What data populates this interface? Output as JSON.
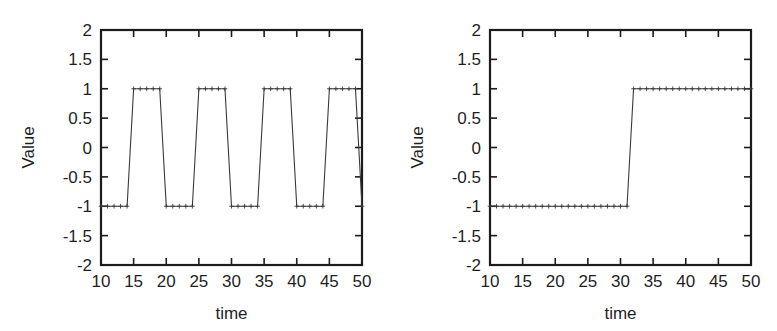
{
  "figure": {
    "background": "#ffffff",
    "line_color": "#3a3a3a",
    "axis_color": "#1c1c1c",
    "panel_count": 2
  },
  "chart_data": [
    {
      "id": "left-panel",
      "type": "line",
      "title": "",
      "xlabel": "time",
      "ylabel": "Value",
      "xlim": [
        10,
        50
      ],
      "ylim": [
        -2,
        2
      ],
      "xticks": [
        10,
        15,
        20,
        25,
        30,
        35,
        40,
        45,
        50
      ],
      "xticklabels": [
        "10",
        "15",
        "20",
        "25",
        "30",
        "35",
        "40",
        "45",
        "50"
      ],
      "yticks": [
        -2,
        -1.5,
        -1,
        -0.5,
        0,
        0.5,
        1,
        1.5,
        2
      ],
      "yticklabels": [
        "-2",
        "-1.5",
        "-1",
        "-0.5",
        "0",
        "0.5",
        "1",
        "1.5",
        "2"
      ],
      "grid": false,
      "legend": "none",
      "marker": "plus",
      "linestyle": "solid",
      "description": "Periodic square wave alternating between -1 and 1 with period 10",
      "x": [
        10,
        11,
        12,
        13,
        14,
        15,
        16,
        17,
        18,
        19,
        20,
        21,
        22,
        23,
        24,
        25,
        26,
        27,
        28,
        29,
        30,
        31,
        32,
        33,
        34,
        35,
        36,
        37,
        38,
        39,
        40,
        41,
        42,
        43,
        44,
        45,
        46,
        47,
        48,
        49,
        50
      ],
      "values": [
        -1,
        -1,
        -1,
        -1,
        -1,
        1,
        1,
        1,
        1,
        1,
        -1,
        -1,
        -1,
        -1,
        -1,
        1,
        1,
        1,
        1,
        1,
        -1,
        -1,
        -1,
        -1,
        -1,
        1,
        1,
        1,
        1,
        1,
        -1,
        -1,
        -1,
        -1,
        -1,
        1,
        1,
        1,
        1,
        1,
        -1
      ]
    },
    {
      "id": "right-panel",
      "type": "line",
      "title": "",
      "xlabel": "time",
      "ylabel": "Value",
      "xlim": [
        10,
        50
      ],
      "ylim": [
        -2,
        2
      ],
      "xticks": [
        10,
        15,
        20,
        25,
        30,
        35,
        40,
        45,
        50
      ],
      "xticklabels": [
        "10",
        "15",
        "20",
        "25",
        "30",
        "35",
        "40",
        "45",
        "50"
      ],
      "yticks": [
        -2,
        -1.5,
        -1,
        -0.5,
        0,
        0.5,
        1,
        1.5,
        2
      ],
      "yticklabels": [
        "-2",
        "-1.5",
        "-1",
        "-0.5",
        "0",
        "0.5",
        "1",
        "1.5",
        "2"
      ],
      "grid": false,
      "legend": "none",
      "marker": "plus",
      "linestyle": "solid",
      "description": "Single step transition from -1 to 1 at time 31",
      "x": [
        10,
        11,
        12,
        13,
        14,
        15,
        16,
        17,
        18,
        19,
        20,
        21,
        22,
        23,
        24,
        25,
        26,
        27,
        28,
        29,
        30,
        31,
        32,
        33,
        34,
        35,
        36,
        37,
        38,
        39,
        40,
        41,
        42,
        43,
        44,
        45,
        46,
        47,
        48,
        49,
        50
      ],
      "values": [
        -1,
        -1,
        -1,
        -1,
        -1,
        -1,
        -1,
        -1,
        -1,
        -1,
        -1,
        -1,
        -1,
        -1,
        -1,
        -1,
        -1,
        -1,
        -1,
        -1,
        -1,
        -1,
        1,
        1,
        1,
        1,
        1,
        1,
        1,
        1,
        1,
        1,
        1,
        1,
        1,
        1,
        1,
        1,
        1,
        1,
        1
      ]
    }
  ]
}
